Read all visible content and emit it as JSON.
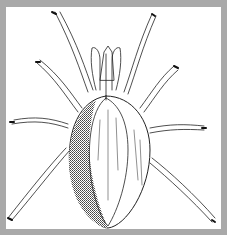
{
  "illustration": {
    "subject": "mite line drawing",
    "frame_color": "#a9a9a9",
    "background_color": "#ffffff",
    "ink_color": "#222222"
  }
}
